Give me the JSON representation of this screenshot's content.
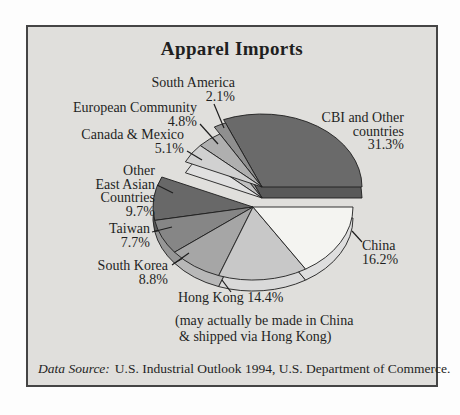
{
  "chart_data": {
    "type": "pie",
    "style": "3d-exploded-two-groups",
    "title": "Apparel Imports",
    "unit": "percent",
    "legend_position": "callout-labels",
    "slices": [
      {
        "id": "cbi-and-other-countries",
        "label": "CBI and Other countries",
        "value": 31.3,
        "pct_label": "31.3%",
        "color": "#6a6a6a",
        "side_color": "#595959",
        "group": "top",
        "label_lines": [
          "CBI and Other",
          "countries",
          "31.3%"
        ]
      },
      {
        "id": "south-america",
        "label": "South America",
        "value": 2.1,
        "pct_label": "2.1%",
        "color": "#8f8f8f",
        "side_color": "#9f9f9f",
        "group": "top",
        "label_lines": [
          "South America",
          "2.1%"
        ]
      },
      {
        "id": "european-community",
        "label": "European Community",
        "value": 4.8,
        "pct_label": "4.8%",
        "color": "#afafaf",
        "side_color": "#c0c0c0",
        "group": "top",
        "label_lines": [
          "European Community",
          "4.8%"
        ]
      },
      {
        "id": "canada-mexico",
        "label": "Canada & Mexico",
        "value": 5.1,
        "pct_label": "5.1%",
        "color": "#d1d1d1",
        "side_color": "#e0e0e0",
        "group": "top",
        "label_lines": [
          "Canada & Mexico",
          "5.1%"
        ]
      },
      {
        "id": "other-east-asian-countries",
        "label": "Other East Asian Countries",
        "value": 9.7,
        "pct_label": "9.7%",
        "color": "#686868",
        "side_color": "#5a5a5a",
        "group": "bottom",
        "label_lines": [
          "Other",
          "East Asian",
          "Countries",
          "9.7%"
        ]
      },
      {
        "id": "taiwan",
        "label": "Taiwan",
        "value": 7.7,
        "pct_label": "7.7%",
        "color": "#868686",
        "side_color": "#969696",
        "group": "bottom",
        "label_lines": [
          "Taiwan",
          "7.7%"
        ]
      },
      {
        "id": "south-korea",
        "label": "South Korea",
        "value": 8.8,
        "pct_label": "8.8%",
        "color": "#a6a6a6",
        "side_color": "#b8b8b8",
        "group": "bottom",
        "label_lines": [
          "South Korea",
          "8.8%"
        ]
      },
      {
        "id": "hong-kong",
        "label": "Hong Kong",
        "value": 14.4,
        "pct_label": "14.4%",
        "color": "#c8c8c8",
        "side_color": "#d9d9d9",
        "group": "bottom",
        "label_lines": [
          "Hong Kong 14.4%"
        ]
      },
      {
        "id": "china",
        "label": "China",
        "value": 16.2,
        "pct_label": "16.2%",
        "color": "#f4f4f1",
        "side_color": "#dedede",
        "group": "bottom",
        "label_lines": [
          "China",
          "16.2%"
        ]
      }
    ],
    "note_lines": [
      "(may actually be made in China",
      "& shipped via Hong Kong)"
    ],
    "source_prefix": "Data Source:",
    "source_text": "U.S. Industrial Outlook 1994, U.S. Department of Commerce."
  }
}
